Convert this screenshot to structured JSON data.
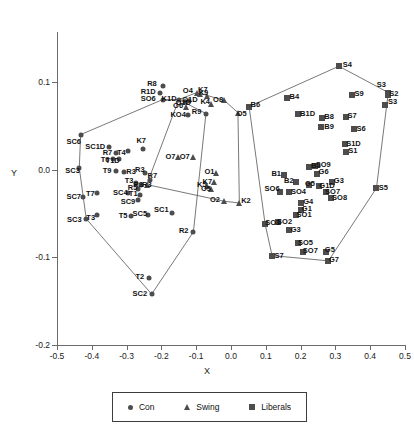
{
  "chart_data": {
    "type": "scatter",
    "title": "",
    "xlabel": "X",
    "ylabel": "Y",
    "xlim": [
      -0.5,
      0.5
    ],
    "ylim": [
      -0.2,
      0.15
    ],
    "grid": false,
    "xticks": [
      "-0.5",
      "-0.4",
      "-0.3",
      "-0.2",
      "-0.1",
      "0.0",
      "0.1",
      "0.2",
      "0.3",
      "0.4",
      "0.5"
    ],
    "xtick_values": [
      -0.5,
      -0.4,
      -0.3,
      -0.2,
      -0.1,
      0.0,
      0.1,
      0.2,
      0.3,
      0.4,
      0.5
    ],
    "yticks": [
      "0.1",
      "0.0",
      "-0.1",
      "-0.2"
    ],
    "ytick_values": [
      0.1,
      0.0,
      -0.1,
      -0.2
    ],
    "legend": {
      "position": "bottom",
      "entries": [
        {
          "label": "Con",
          "marker": "circle",
          "color": "#4d4d4d"
        },
        {
          "label": "Swing",
          "marker": "triangle",
          "color": "#4d4d4d"
        },
        {
          "label": "Liberals",
          "marker": "square",
          "color": "#4d4d4d"
        }
      ]
    },
    "series": [
      {
        "name": "Con",
        "marker": "circle",
        "points": [
          {
            "label": "R8",
            "x": -0.195,
            "y": 0.096,
            "lx": -0.227,
            "ly": 0.098
          },
          {
            "label": "R1D",
            "x": -0.203,
            "y": 0.088,
            "lx": -0.238,
            "ly": 0.089
          },
          {
            "label": "SO6",
            "x": -0.196,
            "y": 0.08,
            "lx": -0.238,
            "ly": 0.081
          },
          {
            "label": "K1D",
            "x": -0.15,
            "y": 0.08,
            "lx": -0.178,
            "ly": 0.081
          },
          {
            "label": "O1D",
            "x": -0.12,
            "y": 0.078,
            "lx": -0.137,
            "ly": 0.076
          },
          {
            "label": "KO4",
            "x": -0.124,
            "y": 0.062,
            "lx": -0.152,
            "ly": 0.062
          },
          {
            "label": "R9",
            "x": -0.072,
            "y": 0.064,
            "lx": -0.099,
            "ly": 0.066
          },
          {
            "label": "SC6",
            "x": -0.432,
            "y": 0.04,
            "lx": -0.452,
            "ly": 0.032
          },
          {
            "label": "SC1D",
            "x": -0.352,
            "y": 0.026,
            "lx": -0.39,
            "ly": 0.026
          },
          {
            "label": "R7",
            "x": -0.33,
            "y": 0.019,
            "lx": -0.355,
            "ly": 0.019
          },
          {
            "label": "T4",
            "x": -0.295,
            "y": 0.021,
            "lx": -0.315,
            "ly": 0.019
          },
          {
            "label": "T1D",
            "x": -0.322,
            "y": 0.012,
            "lx": -0.34,
            "ly": 0.01
          },
          {
            "label": "T6",
            "x": -0.338,
            "y": 0.012,
            "lx": -0.362,
            "ly": 0.011
          },
          {
            "label": "K7",
            "x": -0.254,
            "y": 0.024,
            "lx": -0.258,
            "ly": 0.033
          },
          {
            "label": "SC3",
            "x": -0.436,
            "y": 0.002,
            "lx": -0.455,
            "ly": -0.002
          },
          {
            "label": "T9",
            "x": -0.33,
            "y": -0.002,
            "lx": -0.356,
            "ly": -0.002
          },
          {
            "label": "R3",
            "x": -0.307,
            "y": -0.003,
            "lx": -0.287,
            "ly": -0.003
          },
          {
            "label": "R3",
            "x": -0.247,
            "y": -0.004,
            "lx": -0.262,
            "ly": 0.0
          },
          {
            "label": "R7",
            "x": -0.234,
            "y": -0.012,
            "lx": -0.226,
            "ly": -0.007
          },
          {
            "label": "T3",
            "x": -0.274,
            "y": -0.015,
            "lx": -0.293,
            "ly": -0.013
          },
          {
            "label": "R3",
            "x": -0.258,
            "y": -0.017,
            "lx": -0.267,
            "ly": -0.017
          },
          {
            "label": "R5",
            "x": -0.268,
            "y": -0.022,
            "lx": -0.283,
            "ly": -0.021
          },
          {
            "label": "T1",
            "x": -0.262,
            "y": -0.029,
            "lx": -0.281,
            "ly": -0.028
          },
          {
            "label": "SC4",
            "x": -0.296,
            "y": -0.027,
            "lx": -0.318,
            "ly": -0.027
          },
          {
            "label": "T7",
            "x": -0.384,
            "y": -0.027,
            "lx": -0.404,
            "ly": -0.028
          },
          {
            "label": "SC7",
            "x": -0.424,
            "y": -0.031,
            "lx": -0.452,
            "ly": -0.031
          },
          {
            "label": "SC9",
            "x": -0.268,
            "y": -0.035,
            "lx": -0.296,
            "ly": -0.037
          },
          {
            "label": "SC1",
            "x": -0.17,
            "y": -0.049,
            "lx": -0.2,
            "ly": -0.046
          },
          {
            "label": "SC5",
            "x": -0.238,
            "y": -0.052,
            "lx": -0.262,
            "ly": -0.051
          },
          {
            "label": "T5",
            "x": -0.288,
            "y": -0.053,
            "lx": -0.31,
            "ly": -0.053
          },
          {
            "label": "T3",
            "x": -0.385,
            "y": -0.052,
            "lx": -0.403,
            "ly": -0.055
          },
          {
            "label": "SC3",
            "x": -0.416,
            "y": -0.056,
            "lx": -0.45,
            "ly": -0.057
          },
          {
            "label": "R2",
            "x": -0.108,
            "y": -0.071,
            "lx": -0.136,
            "ly": -0.07
          },
          {
            "label": "T2",
            "x": -0.236,
            "y": -0.124,
            "lx": -0.262,
            "ly": -0.122
          },
          {
            "label": "SC2",
            "x": -0.228,
            "y": -0.142,
            "lx": -0.262,
            "ly": -0.142
          }
        ]
      },
      {
        "name": "Swing",
        "marker": "triangle",
        "points": [
          {
            "label": "O4",
            "x": -0.098,
            "y": 0.088,
            "lx": -0.124,
            "ly": 0.09
          },
          {
            "label": "K9",
            "x": -0.068,
            "y": 0.084,
            "lx": -0.079,
            "ly": 0.088
          },
          {
            "label": "K4",
            "x": -0.057,
            "y": 0.075,
            "lx": -0.074,
            "ly": 0.077
          },
          {
            "label": "O6",
            "x": -0.13,
            "y": 0.072,
            "lx": -0.152,
            "ly": 0.073
          },
          {
            "label": "O1D",
            "x": -0.132,
            "y": 0.078,
            "lx": -0.118,
            "ly": 0.079
          },
          {
            "label": "K7",
            "x": -0.09,
            "y": 0.086,
            "lx": -0.081,
            "ly": 0.091
          },
          {
            "label": "O8",
            "x": -0.019,
            "y": 0.079,
            "lx": -0.037,
            "ly": 0.08
          },
          {
            "label": "O5",
            "x": 0.02,
            "y": 0.065,
            "lx": 0.031,
            "ly": 0.063
          },
          {
            "label": "O7",
            "x": -0.152,
            "y": 0.015,
            "lx": -0.174,
            "ly": 0.015
          },
          {
            "label": "O7",
            "x": -0.11,
            "y": 0.015,
            "lx": -0.133,
            "ly": 0.015
          },
          {
            "label": "O1",
            "x": -0.042,
            "y": -0.004,
            "lx": -0.062,
            "ly": -0.003
          },
          {
            "label": "K7",
            "x": -0.05,
            "y": -0.014,
            "lx": -0.068,
            "ly": -0.014
          },
          {
            "label": "K5",
            "x": -0.07,
            "y": -0.019,
            "lx": -0.084,
            "ly": -0.018
          },
          {
            "label": "O5",
            "x": -0.058,
            "y": -0.022,
            "lx": -0.072,
            "ly": -0.022
          },
          {
            "label": "O2",
            "x": -0.02,
            "y": -0.036,
            "lx": -0.046,
            "ly": -0.035
          },
          {
            "label": "K2",
            "x": 0.024,
            "y": -0.038,
            "lx": 0.043,
            "ly": -0.036
          },
          {
            "label": "R3",
            "x": -0.242,
            "y": -0.017,
            "lx": -0.242,
            "ly": -0.017
          }
        ]
      },
      {
        "name": "Liberals",
        "marker": "square",
        "points": [
          {
            "label": "S4",
            "x": 0.31,
            "y": 0.118,
            "lx": 0.334,
            "ly": 0.119
          },
          {
            "label": "S3",
            "x": 0.452,
            "y": 0.088,
            "lx": 0.432,
            "ly": 0.097
          },
          {
            "label": "S2",
            "x": 0.45,
            "y": 0.085,
            "lx": 0.468,
            "ly": 0.086
          },
          {
            "label": "S3",
            "x": 0.442,
            "y": 0.074,
            "lx": 0.464,
            "ly": 0.077
          },
          {
            "label": "S9",
            "x": 0.348,
            "y": 0.085,
            "lx": 0.368,
            "ly": 0.086
          },
          {
            "label": "B4",
            "x": 0.16,
            "y": 0.082,
            "lx": 0.182,
            "ly": 0.083
          },
          {
            "label": "B6",
            "x": 0.052,
            "y": 0.072,
            "lx": 0.07,
            "ly": 0.074
          },
          {
            "label": "B1D",
            "x": 0.192,
            "y": 0.063,
            "lx": 0.22,
            "ly": 0.063
          },
          {
            "label": "B8",
            "x": 0.262,
            "y": 0.059,
            "lx": 0.282,
            "ly": 0.06
          },
          {
            "label": "S7",
            "x": 0.33,
            "y": 0.06,
            "lx": 0.348,
            "ly": 0.061
          },
          {
            "label": "B9",
            "x": 0.26,
            "y": 0.049,
            "lx": 0.282,
            "ly": 0.049
          },
          {
            "label": "S6",
            "x": 0.354,
            "y": 0.046,
            "lx": 0.374,
            "ly": 0.046
          },
          {
            "label": "S1D",
            "x": 0.328,
            "y": 0.029,
            "lx": 0.352,
            "ly": 0.029
          },
          {
            "label": "S1",
            "x": 0.33,
            "y": 0.02,
            "lx": 0.35,
            "ly": 0.021
          },
          {
            "label": "B3",
            "x": 0.224,
            "y": 0.003,
            "lx": 0.244,
            "ly": 0.004
          },
          {
            "label": "SO9",
            "x": 0.24,
            "y": 0.004,
            "lx": 0.265,
            "ly": 0.005
          },
          {
            "label": "G6",
            "x": 0.248,
            "y": -0.005,
            "lx": 0.266,
            "ly": -0.003
          },
          {
            "label": "B1",
            "x": 0.152,
            "y": -0.006,
            "lx": 0.13,
            "ly": -0.005
          },
          {
            "label": "B2",
            "x": 0.188,
            "y": -0.014,
            "lx": 0.166,
            "ly": -0.013
          },
          {
            "label": "G5",
            "x": 0.225,
            "y": -0.017,
            "lx": 0.227,
            "ly": -0.016
          },
          {
            "label": "G1D",
            "x": 0.252,
            "y": -0.019,
            "lx": 0.276,
            "ly": -0.019
          },
          {
            "label": "G3",
            "x": 0.29,
            "y": -0.014,
            "lx": 0.31,
            "ly": -0.013
          },
          {
            "label": "S5",
            "x": 0.418,
            "y": -0.021,
            "lx": 0.438,
            "ly": -0.021
          },
          {
            "label": "SO6",
            "x": 0.142,
            "y": -0.026,
            "lx": 0.118,
            "ly": -0.022
          },
          {
            "label": "SO4",
            "x": 0.168,
            "y": -0.026,
            "lx": 0.194,
            "ly": -0.026
          },
          {
            "label": "SO7",
            "x": 0.272,
            "y": -0.025,
            "lx": 0.292,
            "ly": -0.025
          },
          {
            "label": "SO8",
            "x": 0.288,
            "y": -0.032,
            "lx": 0.312,
            "ly": -0.032
          },
          {
            "label": "G4",
            "x": 0.202,
            "y": -0.038,
            "lx": 0.222,
            "ly": -0.037
          },
          {
            "label": "G1",
            "x": 0.2,
            "y": -0.046,
            "lx": 0.218,
            "ly": -0.045
          },
          {
            "label": "SO1",
            "x": 0.186,
            "y": -0.052,
            "lx": 0.21,
            "ly": -0.052
          },
          {
            "label": "SO3",
            "x": 0.098,
            "y": -0.062,
            "lx": 0.12,
            "ly": -0.061
          },
          {
            "label": "SO2",
            "x": 0.134,
            "y": -0.06,
            "lx": 0.154,
            "ly": -0.06
          },
          {
            "label": "G3",
            "x": 0.166,
            "y": -0.069,
            "lx": 0.186,
            "ly": -0.069
          },
          {
            "label": "SO5",
            "x": 0.192,
            "y": -0.084,
            "lx": 0.214,
            "ly": -0.084
          },
          {
            "label": "S7",
            "x": 0.118,
            "y": -0.098,
            "lx": 0.138,
            "ly": -0.098
          },
          {
            "label": "SO7",
            "x": 0.208,
            "y": -0.094,
            "lx": 0.228,
            "ly": -0.093
          },
          {
            "label": "G5",
            "x": 0.272,
            "y": -0.094,
            "lx": 0.284,
            "ly": -0.092
          },
          {
            "label": "G7",
            "x": 0.28,
            "y": -0.104,
            "lx": 0.296,
            "ly": -0.103
          }
        ]
      }
    ],
    "hulls": [
      {
        "name": "con-hull",
        "vertices": [
          [
            -0.432,
            0.04
          ],
          [
            -0.196,
            0.08
          ],
          [
            -0.15,
            0.08
          ],
          [
            -0.072,
            0.064
          ],
          [
            -0.108,
            -0.071
          ],
          [
            -0.228,
            -0.142
          ],
          [
            -0.416,
            -0.056
          ],
          [
            -0.436,
            0.002
          ]
        ]
      },
      {
        "name": "swing-hull",
        "vertices": [
          [
            -0.15,
            0.08
          ],
          [
            -0.098,
            0.088
          ],
          [
            -0.019,
            0.079
          ],
          [
            0.02,
            0.065
          ],
          [
            0.024,
            -0.038
          ],
          [
            -0.02,
            -0.036
          ],
          [
            -0.242,
            -0.017
          ]
        ]
      },
      {
        "name": "liberal-hull",
        "vertices": [
          [
            0.052,
            0.072
          ],
          [
            0.31,
            0.118
          ],
          [
            0.452,
            0.088
          ],
          [
            0.418,
            -0.021
          ],
          [
            0.28,
            -0.104
          ],
          [
            0.118,
            -0.098
          ],
          [
            0.098,
            -0.062
          ]
        ]
      }
    ]
  },
  "axes": {
    "x_title": "X",
    "y_title": "Y"
  }
}
